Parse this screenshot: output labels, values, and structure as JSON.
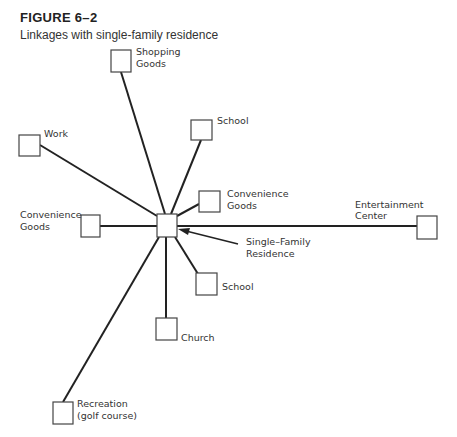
{
  "figure": {
    "number": "FIGURE 6–2",
    "caption": "Linkages with single-family residence"
  },
  "center": {
    "label_line1": "Single–Family",
    "label_line2": "Residence"
  },
  "nodes": [
    {
      "id": "shopping-goods",
      "line1": "Shopping",
      "line2": "Goods"
    },
    {
      "id": "school-top",
      "line1": "School",
      "line2": ""
    },
    {
      "id": "work",
      "line1": "Work",
      "line2": ""
    },
    {
      "id": "convenience-goods-right",
      "line1": "Convenience",
      "line2": "Goods"
    },
    {
      "id": "convenience-goods-left",
      "line1": "Convenience",
      "line2": "Goods"
    },
    {
      "id": "entertainment-center",
      "line1": "Entertainment",
      "line2": "Center"
    },
    {
      "id": "school-bottom",
      "line1": "School",
      "line2": ""
    },
    {
      "id": "church",
      "line1": "Church",
      "line2": ""
    },
    {
      "id": "recreation",
      "line1": "Recreation",
      "line2": "(golf course)"
    }
  ],
  "colors": {
    "line": "#222222",
    "box_stroke": "#444444",
    "background": "#ffffff"
  }
}
